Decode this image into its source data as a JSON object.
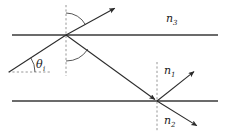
{
  "figure": {
    "background_color": "#ffffff",
    "line_color": "#3a3a3a",
    "ray_color": "#2b2b2b",
    "dash_color": "#8a8a8a",
    "text_color": "#1b1b1b"
  },
  "labels": {
    "n3": {
      "symbol": "n",
      "subscript": "3",
      "x": 166,
      "y": 22
    },
    "n1": {
      "symbol": "n",
      "subscript": "1",
      "x": 164,
      "y": 74
    },
    "n2": {
      "symbol": "n",
      "subscript": "2",
      "x": 164,
      "y": 124
    },
    "theta": {
      "symbol": "θ",
      "subscript": "i",
      "x": 36,
      "y": 68
    }
  },
  "interfaces": [
    {
      "name": "upper-interface",
      "x1": 12,
      "y1": 35,
      "x2": 218,
      "y2": 35
    },
    {
      "name": "lower-interface",
      "x1": 12,
      "y1": 101,
      "x2": 218,
      "y2": 101
    }
  ],
  "normals": [
    {
      "name": "upper-normal",
      "x1": 66,
      "y1": 5,
      "x2": 66,
      "y2": 76
    },
    {
      "name": "lower-normal",
      "x1": 157,
      "y1": 62,
      "x2": 157,
      "y2": 131
    }
  ],
  "reference_line": {
    "name": "horizontal-reference",
    "x1": 8,
    "y1": 72,
    "x2": 50,
    "y2": 72
  },
  "rays": [
    {
      "name": "incident-ray",
      "x1": 9,
      "y1": 72,
      "x2": 66,
      "y2": 35,
      "arrow": false
    },
    {
      "name": "reflected-ray",
      "x1": 66,
      "y1": 35,
      "x2": 117,
      "y2": 7,
      "arrow": true
    },
    {
      "name": "transmitted-ray",
      "x1": 66,
      "y1": 35,
      "x2": 157,
      "y2": 101,
      "arrow": true
    },
    {
      "name": "exit-ray-upper",
      "x1": 157,
      "y1": 101,
      "x2": 196,
      "y2": 70,
      "arrow": true
    },
    {
      "name": "exit-ray-lower",
      "x1": 157,
      "y1": 101,
      "x2": 199,
      "y2": 127,
      "arrow": true
    }
  ],
  "angle_arcs": [
    {
      "name": "reflection-angle-arc",
      "cx": 66,
      "cy": 35,
      "r": 22,
      "start_deg": 270,
      "end_deg": 332
    },
    {
      "name": "incidence-angle-arc",
      "cx": 66,
      "cy": 35,
      "r": 26,
      "start_deg": 33,
      "end_deg": 90
    },
    {
      "name": "theta-angle-arc",
      "cx": 9,
      "cy": 72,
      "r": 26,
      "start_deg": 327,
      "end_deg": 360
    }
  ]
}
